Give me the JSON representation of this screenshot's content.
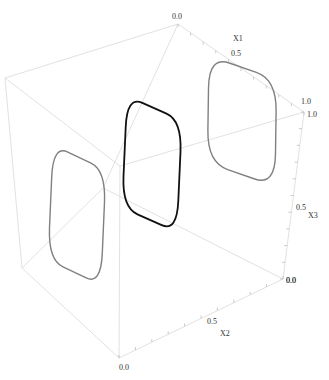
{
  "chart_data": {
    "type": "line3d",
    "title": "",
    "axes": {
      "x1": {
        "label": "X1",
        "range": [
          0.0,
          1.0
        ],
        "ticks": [
          "0.0",
          "0.5",
          "1.0"
        ]
      },
      "x2": {
        "label": "X2",
        "range": [
          0.0,
          1.0
        ],
        "ticks": [
          "0.0",
          "0.5",
          "1.0"
        ]
      },
      "x3": {
        "label": "X3",
        "range": [
          0.0,
          1.0
        ],
        "ticks": [
          "0.0",
          "0.5",
          "1.0"
        ]
      }
    },
    "box": true,
    "grid": false,
    "series": [
      {
        "name": "projection-x2-0",
        "color": "#808080",
        "plane": "X2=0",
        "description": "closed limit-cycle loop projected on the X2=0 face"
      },
      {
        "name": "trajectory-3d",
        "color": "#111111",
        "plane": "3D",
        "description": "closed limit-cycle loop in 3D"
      },
      {
        "name": "projection-x1-0",
        "color": "#808080",
        "plane": "X1=0",
        "description": "closed limit-cycle loop projected on the back face"
      }
    ]
  }
}
